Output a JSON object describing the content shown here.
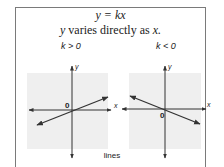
{
  "header": {
    "equation": "y = kx",
    "description_prefix": "y",
    "description_middle": " varies directly as ",
    "description_suffix": "x."
  },
  "graphs": [
    {
      "case_label": "k > 0",
      "x_axis_label": "x",
      "y_axis_label": "y",
      "origin_label": "0",
      "slope_sign": "positive"
    },
    {
      "case_label": "k < 0",
      "x_axis_label": "x",
      "y_axis_label": "y",
      "origin_label": "0",
      "slope_sign": "negative"
    }
  ],
  "footer": {
    "caption": "lines"
  },
  "colors": {
    "panel_bg": "#efefef",
    "axis": "#333333",
    "line": "#333333",
    "border": "#7a7a7a"
  }
}
